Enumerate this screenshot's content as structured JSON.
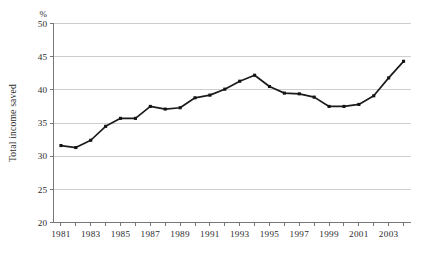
{
  "chart_data": {
    "type": "line",
    "title": "",
    "xlabel": "",
    "ylabel": "Total income saved",
    "unit_label": "%",
    "x": [
      1981,
      1982,
      1983,
      1984,
      1985,
      1986,
      1987,
      1988,
      1989,
      1990,
      1991,
      1992,
      1993,
      1994,
      1995,
      1996,
      1997,
      1998,
      1999,
      2000,
      2001,
      2002,
      2003,
      2004
    ],
    "values": [
      31.6,
      31.3,
      32.4,
      34.5,
      35.7,
      35.7,
      37.5,
      37.1,
      37.3,
      38.8,
      39.2,
      40.1,
      41.3,
      42.2,
      40.5,
      39.5,
      39.4,
      38.9,
      37.5,
      37.5,
      37.8,
      39.1,
      41.8,
      44.3
    ],
    "series": [
      {
        "name": "Total income saved",
        "values": [
          31.6,
          31.3,
          32.4,
          34.5,
          35.7,
          35.7,
          37.5,
          37.1,
          37.3,
          38.8,
          39.2,
          40.1,
          41.3,
          42.2,
          40.5,
          39.5,
          39.4,
          38.9,
          37.5,
          37.5,
          37.8,
          39.1,
          41.8,
          44.3
        ]
      }
    ],
    "ylim": [
      20,
      50
    ],
    "xlim": [
      1980.5,
      2004.5
    ],
    "y_ticks": [
      20,
      25,
      30,
      35,
      40,
      45,
      50
    ],
    "y_tick_labels": [
      "20",
      "25",
      "30",
      "35",
      "40",
      "45",
      "50"
    ],
    "x_ticks": [
      1981,
      1982,
      1983,
      1984,
      1985,
      1986,
      1987,
      1988,
      1989,
      1990,
      1991,
      1992,
      1993,
      1994,
      1995,
      1996,
      1997,
      1998,
      1999,
      2000,
      2001,
      2002,
      2003,
      2004
    ],
    "x_tick_labels": [
      "1981",
      "1983",
      "1985",
      "1987",
      "1989",
      "1991",
      "1993",
      "1995",
      "1997",
      "1999",
      "2001",
      "2003"
    ],
    "x_labelled_ticks": [
      1981,
      1983,
      1985,
      1987,
      1989,
      1991,
      1993,
      1995,
      1997,
      1999,
      2001,
      2003
    ],
    "grid": true,
    "grid_axis": "y",
    "legend": false,
    "legend_position": "none",
    "line_color": "#1b1b1b",
    "marker": "square",
    "grid_color": "#c9c9c9",
    "axis_color": "#777777",
    "background": "#ffffff"
  }
}
